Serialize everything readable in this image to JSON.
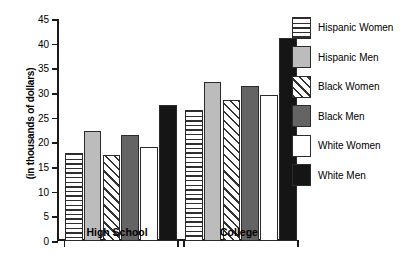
{
  "chart_data": {
    "type": "bar",
    "title": "",
    "xlabel": "",
    "ylabel": "(in thousands of dollars)",
    "categories": [
      "High School",
      "College"
    ],
    "series": [
      {
        "name": "Hispanic Women",
        "pattern": "horizontal-lines",
        "color": "#ffffff",
        "values": [
          17.8,
          26.6
        ]
      },
      {
        "name": "Hispanic Men",
        "pattern": "solid-light-gray",
        "color": "#bcbcbc",
        "values": [
          22.3,
          32.2
        ]
      },
      {
        "name": "Black Women",
        "pattern": "diagonal-hatch",
        "color": "#ffffff",
        "values": [
          17.4,
          28.5
        ]
      },
      {
        "name": "Black Men",
        "pattern": "solid-dark-gray",
        "color": "#646464",
        "values": [
          21.5,
          31.5
        ]
      },
      {
        "name": "White Women",
        "pattern": "solid-white",
        "color": "#ffffff",
        "values": [
          19.1,
          29.5
        ]
      },
      {
        "name": "White Men",
        "pattern": "solid-black",
        "color": "#151515",
        "values": [
          27.5,
          41.2
        ]
      }
    ],
    "ylim": [
      0,
      45
    ],
    "ytick_values": [
      0,
      5,
      10,
      15,
      20,
      25,
      30,
      35,
      40,
      45
    ],
    "ytick_labels": [
      "0",
      "5",
      "10",
      "15",
      "20",
      "25",
      "30",
      "35",
      "40",
      "45"
    ],
    "grid": false,
    "legend_position": "right"
  },
  "axis": {
    "y_title": "(in thousands of dollars)",
    "ticks": [
      "45",
      "40",
      "35",
      "30",
      "25",
      "20",
      "15",
      "10",
      "5",
      "0"
    ]
  },
  "groups": [
    {
      "label": "High School"
    },
    {
      "label": "College"
    }
  ],
  "legend": {
    "items": [
      {
        "label": "Hispanic Women"
      },
      {
        "label": "Hispanic Men"
      },
      {
        "label": "Black Women"
      },
      {
        "label": "Black Men"
      },
      {
        "label": "White Women"
      },
      {
        "label": "White Men"
      }
    ]
  }
}
